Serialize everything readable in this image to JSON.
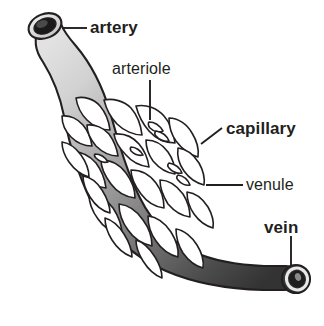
{
  "diagram": {
    "background_color": "#ffffff",
    "outline_color": "#231f20",
    "artery_color": "#d9d9d9",
    "vein_color": "#3d3d3d",
    "mid_color": "#8c8c8c",
    "labels": [
      {
        "id": "artery",
        "text": "artery",
        "weight": "bold",
        "leader": "horizontal"
      },
      {
        "id": "arteriole",
        "text": "arteriole",
        "weight": "regular",
        "leader": "vertical"
      },
      {
        "id": "capillary",
        "text": "capillary",
        "weight": "bold",
        "leader": "diagonal"
      },
      {
        "id": "venule",
        "text": "venule",
        "weight": "regular",
        "leader": "horizontal"
      },
      {
        "id": "vein",
        "text": "vein",
        "weight": "bold",
        "leader": "vertical"
      }
    ]
  }
}
